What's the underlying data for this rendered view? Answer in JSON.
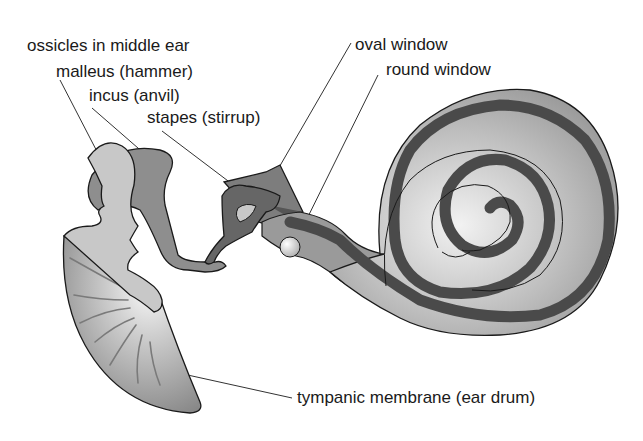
{
  "diagram": {
    "labels": {
      "ossicles": "ossicles in middle ear",
      "malleus": "malleus (hammer)",
      "incus": "incus (anvil)",
      "stapes": "stapes (stirrup)",
      "oval_window": "oval window",
      "round_window": "round window",
      "tympanic_membrane": "tympanic membrane (ear drum)"
    },
    "structures": [
      {
        "id": "malleus",
        "label": "malleus (hammer)",
        "shade": "light gray"
      },
      {
        "id": "incus",
        "label": "incus (anvil)",
        "shade": "medium gray"
      },
      {
        "id": "stapes",
        "label": "stapes (stirrup)",
        "shade": "dark gray"
      },
      {
        "id": "oval_window",
        "label": "oval window"
      },
      {
        "id": "round_window",
        "label": "round window"
      },
      {
        "id": "cochlea",
        "label": ""
      },
      {
        "id": "tympanic_membrane",
        "label": "tympanic membrane (ear drum)"
      }
    ],
    "colors": {
      "background": "#ffffff",
      "outline": "#1a1a1a",
      "malleus_fill": "#c8c8c8",
      "incus_fill": "#8e8e8e",
      "stapes_fill": "#666666",
      "cochlea_outer": "#9a9a9a",
      "cochlea_inner_light": "#e6e6e6",
      "cochlea_band": "#4a4a4a",
      "drum_light": "#f2f2f2",
      "drum_dark": "#8a8a8a",
      "leader_line": "#333333"
    }
  }
}
